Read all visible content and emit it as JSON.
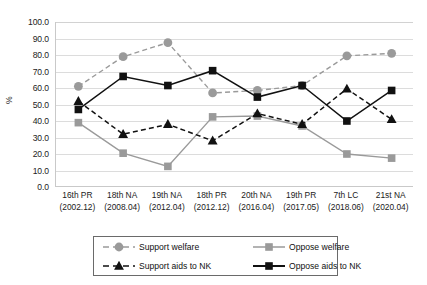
{
  "chart_data": {
    "type": "line",
    "title": "",
    "xlabel": "",
    "ylabel": "%",
    "ylim": [
      0,
      100
    ],
    "ytick_step": 10,
    "grid": true,
    "legend_position": "bottom",
    "categories": [
      "16th PR",
      "18th NA",
      "19th NA",
      "18th PR",
      "20th NA",
      "19th PR",
      "7th LC",
      "21st NA"
    ],
    "category_dates": [
      "(2002.12)",
      "(2008.04)",
      "(2012.04)",
      "(2012.12)",
      "(2016.04)",
      "(2017.05)",
      "(2018.06)",
      "(2020.04)"
    ],
    "ytick_labels": [
      "0.0",
      "10.0",
      "20.0",
      "30.0",
      "40.0",
      "50.0",
      "60.0",
      "70.0",
      "80.0",
      "90.0",
      "100.0"
    ],
    "series": [
      {
        "name": "Support welfare",
        "color": "#9a9a9a",
        "marker": "circle",
        "dash": "dashed",
        "values": [
          61.0,
          79.0,
          87.5,
          57.0,
          58.5,
          61.5,
          79.5,
          81.0
        ]
      },
      {
        "name": "Oppose welfare",
        "color": "#9a9a9a",
        "marker": "square",
        "dash": "solid",
        "values": [
          39.0,
          20.5,
          12.5,
          42.5,
          43.0,
          37.0,
          20.0,
          17.5
        ]
      },
      {
        "name": "Support aids to NK",
        "color": "#111111",
        "marker": "triangle",
        "dash": "dashed",
        "values": [
          52.0,
          32.0,
          38.0,
          28.0,
          44.5,
          38.0,
          59.5,
          41.0
        ]
      },
      {
        "name": "Oppose aids to NK",
        "color": "#111111",
        "marker": "square",
        "dash": "solid",
        "values": [
          47.0,
          67.0,
          61.5,
          70.5,
          54.5,
          61.5,
          40.0,
          58.5
        ]
      }
    ]
  },
  "legend": {
    "items": [
      {
        "label": "Support welfare"
      },
      {
        "label": "Oppose welfare"
      },
      {
        "label": "Support aids to NK"
      },
      {
        "label": "Oppose aids to NK"
      }
    ]
  }
}
